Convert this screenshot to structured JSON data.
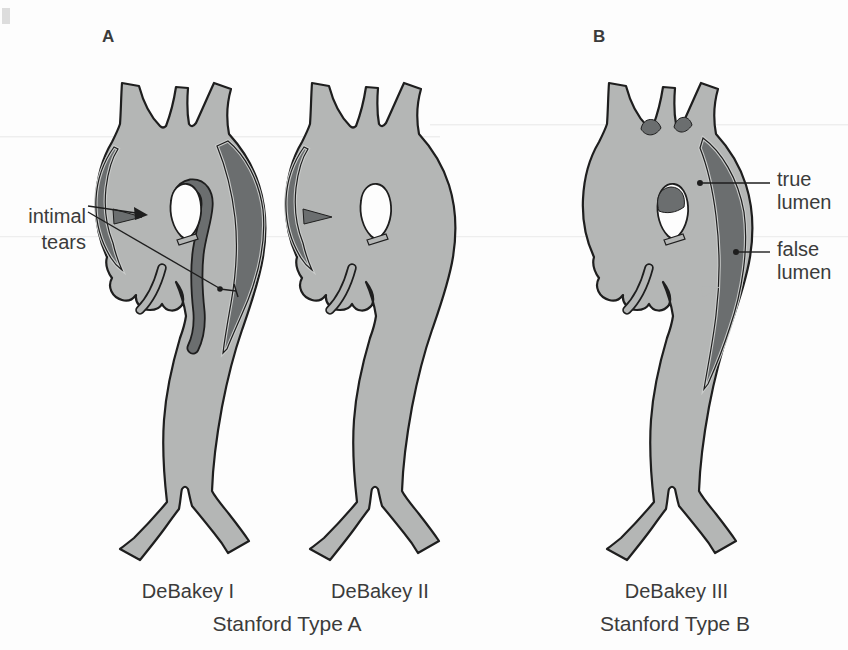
{
  "figure": {
    "panel_a_label": "A",
    "panel_b_label": "B"
  },
  "annotations": {
    "intimal_tears_line1": "intimal",
    "intimal_tears_line2": "tears",
    "true_lumen_line1": "true",
    "true_lumen_line2": "lumen",
    "false_lumen_line1": "false",
    "false_lumen_line2": "lumen"
  },
  "captions": {
    "debakey_1": "DeBakey I",
    "debakey_2": "DeBakey II",
    "debakey_3": "DeBakey III",
    "stanford_type_a": "Stanford Type A",
    "stanford_type_b": "Stanford Type B"
  },
  "colors": {
    "aorta_fill": "#b4b6b5",
    "false_lumen_fill": "#6b6e6f",
    "outline": "#1e1e1e",
    "gap_light": "#c9cbca",
    "text": "#3b3b3b",
    "background": "#fdfdfd"
  }
}
